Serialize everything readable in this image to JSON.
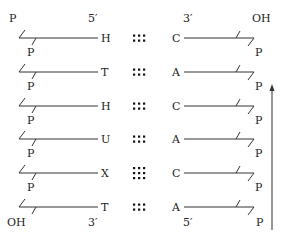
{
  "diagram": {
    "type": "double-stranded nucleic acid base pairing",
    "left_strand": {
      "top_end_label": "5′",
      "bottom_end_label": "3′",
      "top_group": "P",
      "bottom_group": "OH",
      "bases": [
        "H",
        "T",
        "H",
        "U",
        "X",
        "T"
      ],
      "phosphate_labels": [
        "P",
        "P",
        "P",
        "P",
        "P",
        "P"
      ]
    },
    "right_strand": {
      "top_end_label": "3′",
      "bottom_end_label": "5′",
      "top_group": "OH",
      "bottom_group": "P",
      "bases": [
        "C",
        "A",
        "C",
        "A",
        "C",
        "A"
      ],
      "phosphate_labels": [
        "P",
        "P",
        "P",
        "P",
        "P",
        "P"
      ]
    },
    "pairs": [
      {
        "left": "H",
        "right": "C",
        "hbond_dots": 6,
        "rows": 2,
        "cols": 3
      },
      {
        "left": "T",
        "right": "A",
        "hbond_dots": 6,
        "rows": 2,
        "cols": 3
      },
      {
        "left": "H",
        "right": "C",
        "hbond_dots": 6,
        "rows": 2,
        "cols": 3
      },
      {
        "left": "U",
        "right": "A",
        "hbond_dots": 6,
        "rows": 2,
        "cols": 3
      },
      {
        "left": "X",
        "right": "C",
        "hbond_dots": 9,
        "rows": 3,
        "cols": 3
      },
      {
        "left": "T",
        "right": "A",
        "hbond_dots": 6,
        "rows": 2,
        "cols": 3
      }
    ],
    "arrow": {
      "direction": "up",
      "meaning": "5′→3′ direction of right strand"
    },
    "colors": {
      "ink": "#222222",
      "background": "#ffffff"
    }
  }
}
